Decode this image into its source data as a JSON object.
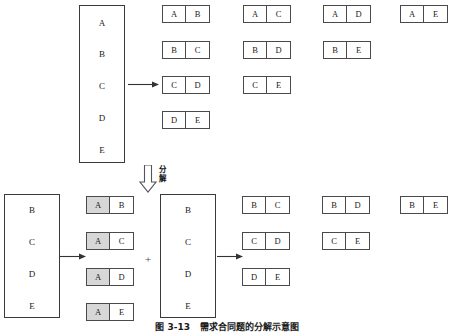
{
  "figure": {
    "caption": "图 3-13   需求合同题的分解示意图",
    "decompose_label": "分\n解",
    "plus_symbol": "+"
  },
  "top_section": {
    "source_box": {
      "name": "source-set",
      "items": [
        "A",
        "B",
        "C",
        "D",
        "E"
      ]
    },
    "pair_columns": [
      {
        "pairs": [
          {
            "left": "A",
            "right": "B",
            "shaded": false
          },
          {
            "left": "B",
            "right": "C",
            "shaded": false
          },
          {
            "left": "C",
            "right": "D",
            "shaded": false
          },
          {
            "left": "D",
            "right": "E",
            "shaded": false
          }
        ]
      },
      {
        "pairs": [
          {
            "left": "A",
            "right": "C",
            "shaded": false
          },
          {
            "left": "B",
            "right": "D",
            "shaded": false
          },
          {
            "left": "C",
            "right": "E",
            "shaded": false
          }
        ]
      },
      {
        "pairs": [
          {
            "left": "A",
            "right": "D",
            "shaded": false
          },
          {
            "left": "B",
            "right": "E",
            "shaded": false
          }
        ]
      },
      {
        "pairs": [
          {
            "left": "A",
            "right": "E",
            "shaded": false
          }
        ]
      }
    ]
  },
  "bottom_section": {
    "left_group": {
      "source_box": {
        "name": "sub-set-left",
        "items": [
          "B",
          "C",
          "D",
          "E"
        ]
      },
      "pairs": [
        {
          "left": "A",
          "right": "B",
          "shaded": true
        },
        {
          "left": "A",
          "right": "C",
          "shaded": true
        },
        {
          "left": "A",
          "right": "D",
          "shaded": true
        },
        {
          "left": "A",
          "right": "E",
          "shaded": true
        }
      ]
    },
    "right_group": {
      "source_box": {
        "name": "sub-set-right",
        "items": [
          "B",
          "C",
          "D",
          "E"
        ]
      },
      "pair_columns": [
        {
          "pairs": [
            {
              "left": "B",
              "right": "C",
              "shaded": false
            },
            {
              "left": "C",
              "right": "D",
              "shaded": false
            },
            {
              "left": "D",
              "right": "E",
              "shaded": false
            }
          ]
        },
        {
          "pairs": [
            {
              "left": "B",
              "right": "D",
              "shaded": false
            },
            {
              "left": "C",
              "right": "E",
              "shaded": false
            }
          ]
        },
        {
          "pairs": [
            {
              "left": "B",
              "right": "E",
              "shaded": false
            }
          ]
        }
      ]
    }
  },
  "colors": {
    "stroke": "#4a4a4a",
    "shade": "#d7d7d7",
    "background": "#ffffff",
    "text": "#1a1a1a"
  }
}
